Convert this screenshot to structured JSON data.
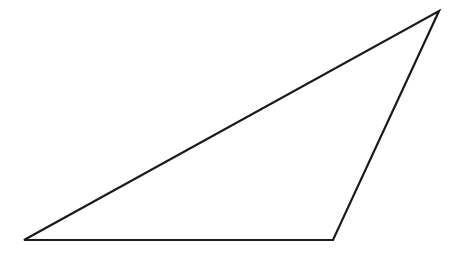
{
  "diagram": {
    "type": "triangle",
    "shape": "obtuse-scalene-triangle",
    "background_color": "#ffffff",
    "stroke_color": "#1a1a1a",
    "fill_color": "none",
    "stroke_width": 2.2,
    "vertices": [
      {
        "name": "bottom-left",
        "x": 24,
        "y": 240
      },
      {
        "name": "bottom-right",
        "x": 333,
        "y": 240
      },
      {
        "name": "top-right",
        "x": 439,
        "y": 11
      }
    ],
    "labels": []
  }
}
